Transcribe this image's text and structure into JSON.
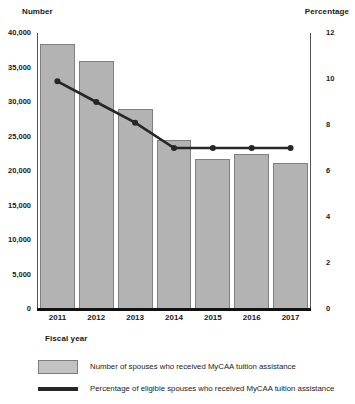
{
  "chart_data": {
    "type": "bar",
    "title": "",
    "xlabel": "Fiscal year",
    "ylabel": "Number",
    "y2label": "Percentage",
    "categories": [
      "2011",
      "2012",
      "2013",
      "2014",
      "2015",
      "2016",
      "2017"
    ],
    "ylim": [
      0,
      40000
    ],
    "y2lim": [
      0,
      12
    ],
    "yticks": [
      "0",
      "5,000",
      "10,000",
      "15,000",
      "20,000",
      "25,000",
      "30,000",
      "35,000",
      "40,000"
    ],
    "ytick_values": [
      0,
      5000,
      10000,
      15000,
      20000,
      25000,
      30000,
      35000,
      40000
    ],
    "y2ticks": [
      "0",
      "2",
      "4",
      "6",
      "8",
      "10",
      "12"
    ],
    "y2tick_values": [
      0,
      2,
      4,
      6,
      8,
      10,
      12
    ],
    "grid": false,
    "legend_position": "below",
    "series": [
      {
        "name": "Number of spouses who received MyCAA tuition assistance",
        "type": "bar",
        "axis": "left",
        "values": [
          38400,
          36000,
          29000,
          24500,
          21800,
          22500,
          21200
        ],
        "color": "#b3b3b3"
      },
      {
        "name": "Percentage of eligible spouses who received MyCAA tuition assistance",
        "type": "line",
        "axis": "right",
        "values": [
          9.9,
          9.0,
          8.1,
          7.0,
          7.0,
          7.0,
          7.0
        ],
        "color": "#262626"
      }
    ]
  },
  "labels": {
    "left_axis_title": "Number",
    "right_axis_title": "Percentage",
    "x_axis_title": "Fiscal year"
  },
  "legend": {
    "items": [
      {
        "marker": "filled-square-swatch",
        "label": "Number of spouses who received MyCAA tuition assistance"
      },
      {
        "marker": "thick-line-swatch",
        "label": "Percentage of eligible spouses who received MyCAA tuition assistance"
      }
    ]
  }
}
